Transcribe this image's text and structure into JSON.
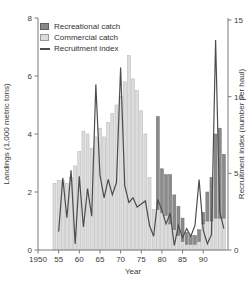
{
  "figure": {
    "background": "#ffffff",
    "plot_colors": {
      "recreational_bar": "#8a8a8a",
      "recreational_border": "#6e6e6e",
      "commercial_bar": "#dcdcdc",
      "commercial_border": "#b3b3b3",
      "recruitment_line": "#4d4d4d",
      "axis": "#7a7a7a",
      "text": "#3a3a3a"
    }
  },
  "chart_data": {
    "type": "bar",
    "subtype": "stacked-bars-with-line-overlay",
    "title": "",
    "categories": [
      1954,
      1955,
      1956,
      1957,
      1958,
      1959,
      1960,
      1961,
      1962,
      1963,
      1964,
      1965,
      1966,
      1967,
      1968,
      1969,
      1970,
      1971,
      1972,
      1973,
      1974,
      1975,
      1976,
      1977,
      1978,
      1979,
      1980,
      1981,
      1982,
      1983,
      1984,
      1985,
      1986,
      1987,
      1988,
      1989,
      1990,
      1991,
      1992,
      1993,
      1994,
      1995
    ],
    "series": [
      {
        "name": "Commercial catch",
        "type": "bar",
        "stack_order": "bottom",
        "axis": "left",
        "values": [
          2.3,
          2.4,
          2.4,
          2.3,
          2.5,
          2.9,
          3.4,
          4.1,
          4.0,
          3.5,
          3.9,
          4.2,
          3.9,
          4.4,
          4.7,
          5.0,
          5.3,
          5.8,
          6.7,
          5.9,
          5.5,
          4.8,
          4.0,
          2.5,
          1.4,
          1.4,
          1.3,
          1.2,
          0.9,
          0.7,
          0.5,
          0.3,
          0.2,
          0.2,
          0.2,
          0.3,
          0.9,
          1.0,
          1.0,
          1.1,
          1.1,
          1.1
        ]
      },
      {
        "name": "Recreational catch",
        "type": "bar",
        "stack_order": "top",
        "axis": "left",
        "values": [
          0,
          0,
          0,
          0,
          0,
          0,
          0,
          0,
          0,
          0,
          0,
          0,
          0,
          0,
          0,
          0,
          0,
          0,
          0,
          0,
          0,
          0,
          0,
          0,
          0,
          3.2,
          1.5,
          1.4,
          1.7,
          1.2,
          1.0,
          0.8,
          0.4,
          0.3,
          0.3,
          0.4,
          0.4,
          1.0,
          1.5,
          2.9,
          3.1,
          2.2
        ]
      },
      {
        "name": "Recruitment index",
        "type": "line",
        "axis": "right",
        "values": [
          null,
          1.2,
          4.7,
          2.1,
          5.2,
          0.4,
          4.8,
          1.5,
          4.0,
          2.2,
          10.8,
          4.9,
          3.4,
          4.6,
          3.6,
          4.4,
          11.9,
          4.2,
          3.1,
          3.4,
          2.8,
          3.0,
          3.2,
          1.6,
          0.9,
          3.3,
          2.6,
          1.7,
          2.4,
          0.3,
          1.6,
          0.8,
          1.4,
          0.9,
          1.6,
          4.6,
          1.3,
          0.4,
          1.0,
          13.7,
          2.5,
          1.4
        ]
      }
    ],
    "x_axis": {
      "label": "Year",
      "range": [
        1950,
        1996
      ],
      "ticks": [
        1950,
        1955,
        1960,
        1965,
        1970,
        1975,
        1980,
        1985,
        1990
      ],
      "tick_labels": [
        "1950",
        "55",
        "60",
        "65",
        "70",
        "75",
        "80",
        "85",
        "90"
      ]
    },
    "y_axis_left": {
      "label": "Landings (1,000 metric tons)",
      "range": [
        0,
        8
      ],
      "ticks": [
        0,
        2,
        4,
        6,
        8
      ]
    },
    "y_axis_right": {
      "label": "Recruitment index (number per haul)",
      "range": [
        0,
        15
      ],
      "ticks": [
        0,
        5,
        10,
        15
      ]
    },
    "legend": {
      "position": "top-left",
      "items": [
        {
          "label": "Recreational catch",
          "swatch": "dark-square"
        },
        {
          "label": "Commercial catch",
          "swatch": "light-square"
        },
        {
          "label": "Recruitment index",
          "swatch": "line"
        }
      ]
    },
    "grid": "off"
  }
}
